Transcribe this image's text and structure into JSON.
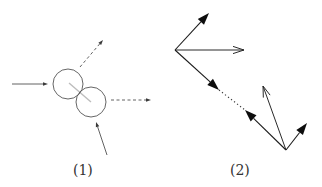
{
  "colors": {
    "line": "#3a3a3a",
    "circle": "#555555",
    "center_line": "#bdbdbd",
    "background": "#ffffff"
  },
  "panels": [
    {
      "id": "panel-1",
      "label": "(1)",
      "description": "Two colliding disks with incoming solid arrows and outgoing dashed arrows",
      "circles": [
        {
          "cx": 68,
          "cy": 84,
          "r": 15
        },
        {
          "cx": 91,
          "cy": 102,
          "r": 15
        }
      ],
      "center_line": {
        "x1": 69,
        "y1": 83,
        "x2": 91,
        "y2": 102
      },
      "arrows": [
        {
          "name": "incoming-left-arrow",
          "x1": 12,
          "y1": 84,
          "x2": 48,
          "y2": 84,
          "style": "solid"
        },
        {
          "name": "incoming-bottom-arrow",
          "x1": 107,
          "y1": 155,
          "x2": 96,
          "y2": 122,
          "style": "solid"
        },
        {
          "name": "outgoing-upper-arrow",
          "x1": 80,
          "y1": 67,
          "x2": 103,
          "y2": 40,
          "style": "dashed"
        },
        {
          "name": "outgoing-right-arrow",
          "x1": 111,
          "y1": 100,
          "x2": 151,
          "y2": 100,
          "style": "dashed"
        }
      ]
    },
    {
      "id": "panel-2",
      "label": "(2)",
      "description": "Vector diagram with filled and open arrowheads connected by a dotted segment",
      "arrows": [
        {
          "name": "upper-filled-arrow",
          "x1": 175,
          "y1": 50,
          "x2": 209,
          "y2": 13,
          "head": "filled"
        },
        {
          "name": "horizontal-open-arrow",
          "x1": 175,
          "y1": 50,
          "x2": 244,
          "y2": 50,
          "head": "open"
        },
        {
          "name": "diagonal-filled-arrow-1",
          "x1": 175,
          "y1": 50,
          "x2": 219,
          "y2": 90,
          "head": "filled"
        },
        {
          "name": "diagonal-filled-arrow-2",
          "x1": 286,
          "y1": 150,
          "x2": 245,
          "y2": 110,
          "head": "filled"
        },
        {
          "name": "vertical-open-arrow",
          "x1": 286,
          "y1": 150,
          "x2": 263,
          "y2": 86,
          "head": "open"
        },
        {
          "name": "right-filled-arrow",
          "x1": 286,
          "y1": 150,
          "x2": 307,
          "y2": 123,
          "head": "filled"
        }
      ],
      "dotted_segment": {
        "x1": 219,
        "y1": 90,
        "x2": 245,
        "y2": 110
      }
    }
  ]
}
